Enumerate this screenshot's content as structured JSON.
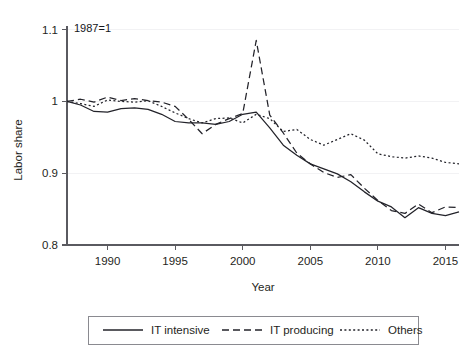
{
  "figure": {
    "note": "1987=1",
    "top_artifact_left": "",
    "top_artifact_mid": "",
    "top_artifact_right": ""
  },
  "chart_data": {
    "type": "line",
    "title": "",
    "subtitle": "",
    "annotation": "1987=1",
    "xlabel": "Year",
    "ylabel": "Labor share",
    "xlim": [
      1987,
      2016
    ],
    "ylim": [
      0.8,
      1.105
    ],
    "xticks": [
      1990,
      1995,
      2000,
      2005,
      2010,
      2015
    ],
    "xtick_labels": [
      "1990",
      "1995",
      "2000",
      "2005",
      "2010",
      "2015"
    ],
    "yticks": [
      0.8,
      0.9,
      1,
      1.1
    ],
    "ytick_labels": [
      "0.8",
      "0.9",
      "1",
      "1.1"
    ],
    "grid": false,
    "legend_position": "bottom",
    "x": [
      1987,
      1988,
      1989,
      1990,
      1991,
      1992,
      1993,
      1994,
      1995,
      1996,
      1997,
      1998,
      1999,
      2000,
      2001,
      2002,
      2003,
      2004,
      2005,
      2006,
      2007,
      2008,
      2009,
      2010,
      2011,
      2012,
      2013,
      2014,
      2015,
      2016
    ],
    "series": [
      {
        "name": "IT intensive",
        "style": "solid",
        "values": [
          1.0,
          0.995,
          0.986,
          0.985,
          0.99,
          0.991,
          0.989,
          0.982,
          0.972,
          0.97,
          0.97,
          0.968,
          0.972,
          0.982,
          0.985,
          0.963,
          0.939,
          0.925,
          0.913,
          0.906,
          0.899,
          0.888,
          0.874,
          0.861,
          0.853,
          0.838,
          0.852,
          0.844,
          0.841,
          0.846
        ]
      },
      {
        "name": "IT producing",
        "style": "dashed",
        "values": [
          1.0,
          1.003,
          0.999,
          1.006,
          1.001,
          1.004,
          1.001,
          0.999,
          0.993,
          0.975,
          0.955,
          0.968,
          0.976,
          0.983,
          1.085,
          0.981,
          0.956,
          0.928,
          0.913,
          0.901,
          0.894,
          0.898,
          0.879,
          0.862,
          0.848,
          0.844,
          0.857,
          0.845,
          0.853,
          0.852
        ]
      },
      {
        "name": "Others",
        "style": "dotted",
        "values": [
          1.0,
          0.997,
          0.993,
          1.002,
          1.0,
          0.999,
          1.001,
          0.993,
          0.984,
          0.976,
          0.97,
          0.976,
          0.977,
          0.97,
          0.982,
          0.976,
          0.958,
          0.961,
          0.947,
          0.939,
          0.947,
          0.955,
          0.946,
          0.927,
          0.923,
          0.921,
          0.924,
          0.921,
          0.915,
          0.913
        ]
      }
    ]
  },
  "legend": {
    "entries": [
      {
        "label": "IT intensive",
        "style": "solid"
      },
      {
        "label": "IT producing",
        "style": "dashed"
      },
      {
        "label": "Others",
        "style": "dotted"
      }
    ]
  }
}
